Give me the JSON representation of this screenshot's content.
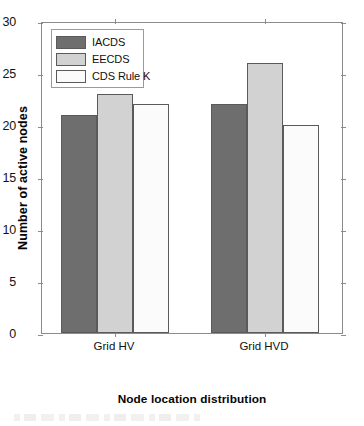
{
  "chart_data": {
    "type": "bar",
    "title": "",
    "xlabel": "Node location distribution",
    "ylabel": "Number of active nodes",
    "categories": [
      "Grid HV",
      "Grid HVD"
    ],
    "series": [
      {
        "name": "IACDS",
        "values": [
          21,
          23
        ]
      },
      {
        "name": "EECDS",
        "values": [
          23,
          26
        ]
      },
      {
        "name": "CDS Rule K",
        "values": [
          22,
          20
        ]
      }
    ],
    "series_corrected": [
      {
        "name": "IACDS",
        "values": [
          21,
          22
        ],
        "color": "#6e6e6e"
      },
      {
        "name": "EECDS",
        "values": [
          23,
          26
        ],
        "color": "#d2d2d2"
      },
      {
        "name": "CDS Rule K",
        "values": [
          22,
          20
        ],
        "color": "#fbfbfb"
      }
    ],
    "ylim": [
      0,
      30
    ],
    "yticks": [
      0,
      5,
      10,
      15,
      20,
      25,
      30
    ],
    "ytick_labels": [
      "0",
      "5",
      "10",
      "15",
      "20",
      "25",
      "30"
    ],
    "grid": false,
    "legend_position": "upper-left-inside",
    "bar_edge_color": "#5a5a5a",
    "axis_color": "#8c8c8c"
  },
  "legend": {
    "entries": [
      {
        "label": "IACDS",
        "color": "#6e6e6e"
      },
      {
        "label": "EECDS",
        "color": "#d2d2d2"
      },
      {
        "label": "CDS Rule K",
        "color": "#fbfbfb"
      }
    ]
  },
  "axes": {
    "y_title": "Number of active nodes",
    "x_title": "Node location distribution",
    "y_tick_labels": [
      "30",
      "25",
      "20",
      "15",
      "10",
      "5",
      "0"
    ],
    "x_tick_labels": [
      "Grid HV",
      "Grid HVD"
    ]
  }
}
